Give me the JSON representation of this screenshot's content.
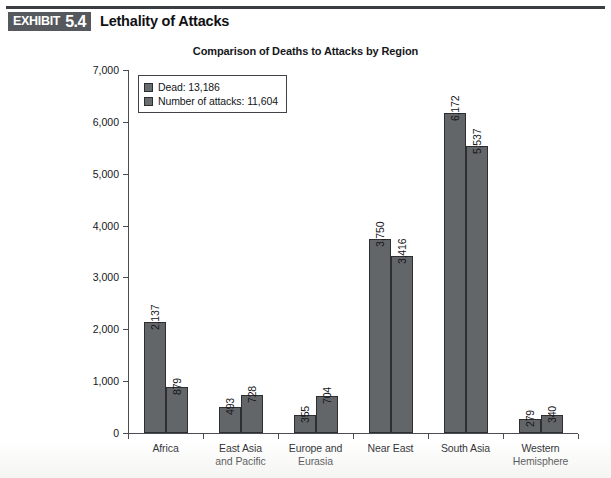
{
  "exhibit": {
    "word": "EXHIBIT",
    "number": "5.4",
    "title": "Lethality of Attacks"
  },
  "chart_data": {
    "type": "bar",
    "title": "Comparison of Deaths to Attacks by Region",
    "xlabel": "",
    "ylabel": "",
    "ylim": [
      0,
      7000
    ],
    "yticks": [
      "0",
      "1,000",
      "2,000",
      "3,000",
      "4,000",
      "5,000",
      "6,000",
      "7,000"
    ],
    "grid": false,
    "legend_position": "top-left-inside",
    "categories": [
      "Africa",
      "East Asia and Pacific",
      "Europe and Eurasia",
      "Near East",
      "South Asia",
      "Western Hemisphere"
    ],
    "category_lines": [
      [
        "Africa"
      ],
      [
        "East Asia",
        "and Pacific"
      ],
      [
        "Europe and",
        "Eurasia"
      ],
      [
        "Near East"
      ],
      [
        "South Asia"
      ],
      [
        "Western",
        "Hemisphere"
      ]
    ],
    "series": [
      {
        "name": "Dead: 13,186",
        "short_name": "Dead",
        "total": "13,186",
        "color": "#636669",
        "values": [
          2137,
          493,
          355,
          3750,
          6172,
          279
        ],
        "labels": [
          "2,137",
          "493",
          "355",
          "3,750",
          "6,172",
          "279"
        ]
      },
      {
        "name": "Number of attacks: 11,604",
        "short_name": "Number of attacks",
        "total": "11,604",
        "color": "#636669",
        "values": [
          879,
          728,
          704,
          3416,
          5537,
          340
        ],
        "labels": [
          "879",
          "728",
          "704",
          "3,416",
          "5,537",
          "340"
        ]
      }
    ]
  },
  "colors": {
    "bar_fill": "#636669",
    "bar_edge": "#2c2e31",
    "axis": "#4a4d52",
    "tag_background": "#55585d",
    "text": "#15161a"
  }
}
